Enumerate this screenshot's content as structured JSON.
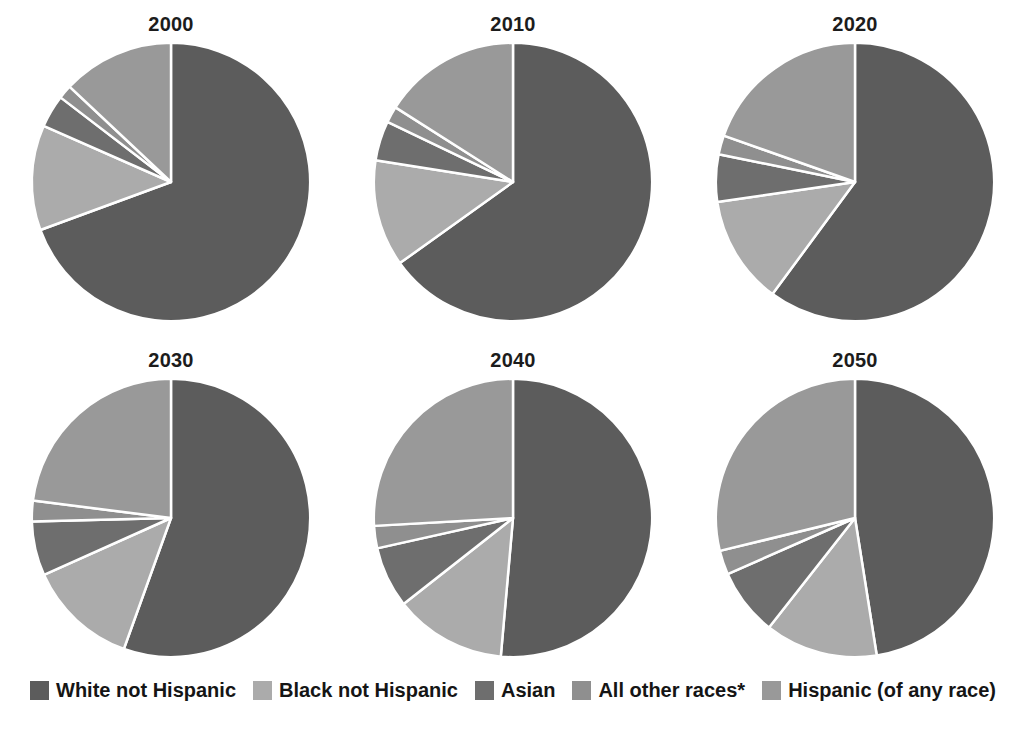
{
  "chart_data": {
    "type": "pie",
    "title": "",
    "subtitle": "",
    "xlabel": "",
    "ylabel": "",
    "legend_position": "bottom",
    "grid": false,
    "units": "percent of total population",
    "start_angle_deg": 0,
    "direction": "clockwise",
    "categories": [
      "White not Hispanic",
      "Black not Hispanic",
      "Asian",
      "All other races*",
      "Hispanic (of any race)"
    ],
    "colors": [
      "#5c5c5c",
      "#ababab",
      "#6e6e6e",
      "#8f8f8f",
      "#999999"
    ],
    "panels": [
      {
        "label": "2000",
        "values": [
          69.4,
          12.2,
          3.8,
          1.6,
          13.0
        ]
      },
      {
        "label": "2010",
        "values": [
          65.1,
          12.4,
          4.6,
          1.9,
          16.0
        ]
      },
      {
        "label": "2020",
        "values": [
          60.1,
          12.6,
          5.5,
          2.2,
          19.6
        ]
      },
      {
        "label": "2030",
        "values": [
          55.5,
          12.8,
          6.3,
          2.4,
          23.0
        ]
      },
      {
        "label": "2040",
        "values": [
          51.4,
          13.0,
          7.1,
          2.6,
          25.9
        ]
      },
      {
        "label": "2050",
        "values": [
          47.5,
          13.1,
          7.8,
          2.8,
          28.8
        ]
      }
    ]
  },
  "panels": [
    {
      "title": "2000"
    },
    {
      "title": "2010"
    },
    {
      "title": "2020"
    },
    {
      "title": "2030"
    },
    {
      "title": "2040"
    },
    {
      "title": "2050"
    }
  ],
  "legend": {
    "items": [
      {
        "label": "White not Hispanic",
        "color": "#5c5c5c"
      },
      {
        "label": "Black not Hispanic",
        "color": "#ababab"
      },
      {
        "label": "Asian",
        "color": "#6e6e6e"
      },
      {
        "label": "All other races*",
        "color": "#8f8f8f"
      },
      {
        "label": "Hispanic (of any race)",
        "color": "#999999"
      }
    ]
  },
  "style": {
    "background": "#ffffff",
    "separator_color": "#ffffff",
    "text_color": "#151515"
  }
}
